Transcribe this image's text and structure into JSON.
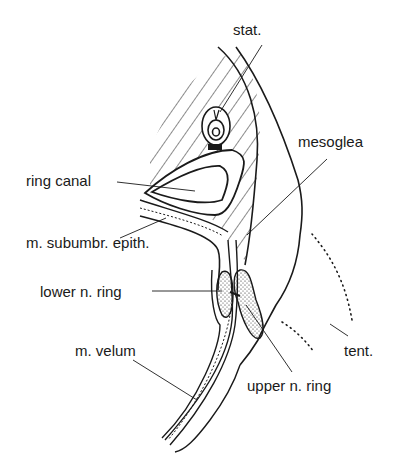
{
  "diagram": {
    "type": "anatomical cross-section",
    "colors": {
      "ink": "#1a1a1a",
      "background": "#ffffff"
    },
    "labels": [
      {
        "id": "stat",
        "text": "stat.",
        "x": 233,
        "y": 34
      },
      {
        "id": "mesoglea",
        "text": "mesoglea",
        "x": 298,
        "y": 139
      },
      {
        "id": "ring-canal",
        "text": "ring canal",
        "x": 26,
        "y": 175
      },
      {
        "id": "subumbr-epith",
        "text": "m. subumbr. epith.",
        "x": 26,
        "y": 240
      },
      {
        "id": "lower-n-ring",
        "text": "lower n. ring",
        "x": 40,
        "y": 286
      },
      {
        "id": "m-velum",
        "text": "m. velum",
        "x": 75,
        "y": 346
      },
      {
        "id": "tent",
        "text": "tent.",
        "x": 344,
        "y": 346
      },
      {
        "id": "upper-n-ring",
        "text": "upper n. ring",
        "x": 247,
        "y": 382
      }
    ]
  }
}
